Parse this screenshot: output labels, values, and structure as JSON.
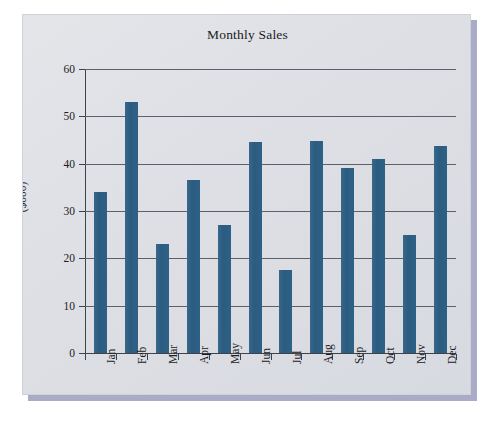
{
  "chart_data": {
    "type": "bar",
    "title": "Monthly Sales",
    "xlabel": "",
    "ylabel": "($000)",
    "categories": [
      "Jan",
      "Feb",
      "Mar",
      "Apr",
      "May",
      "Jun",
      "Jul",
      "Aug",
      "Sep",
      "Oct",
      "Nov",
      "Dec"
    ],
    "values": [
      34,
      53,
      23,
      36.5,
      27,
      44.5,
      17.5,
      44.7,
      39,
      41,
      25,
      43.7
    ],
    "ylim": [
      0,
      60
    ],
    "ytick_labels": [
      "0",
      "10",
      "20",
      "30",
      "40",
      "50",
      "60"
    ],
    "ytick_values": [
      0,
      10,
      20,
      30,
      40,
      50,
      60
    ],
    "grid": "horizontal",
    "legend": "none",
    "series_color": "#2e6186",
    "panel_color": "#dfe1e6",
    "axis_color": "#3f4248"
  }
}
